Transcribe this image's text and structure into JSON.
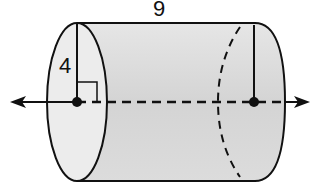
{
  "figure": {
    "type": "cylinder",
    "labels": {
      "length": "9",
      "radius": "4"
    },
    "colors": {
      "body_fill": "#d9d9d9",
      "cap_fill": "#ececec",
      "stroke": "#111111",
      "background": "#ffffff"
    },
    "annotations": {
      "axis": "horizontal axis of rotation with arrows at both ends",
      "right_angle_marker": true,
      "center_points": 2
    }
  }
}
